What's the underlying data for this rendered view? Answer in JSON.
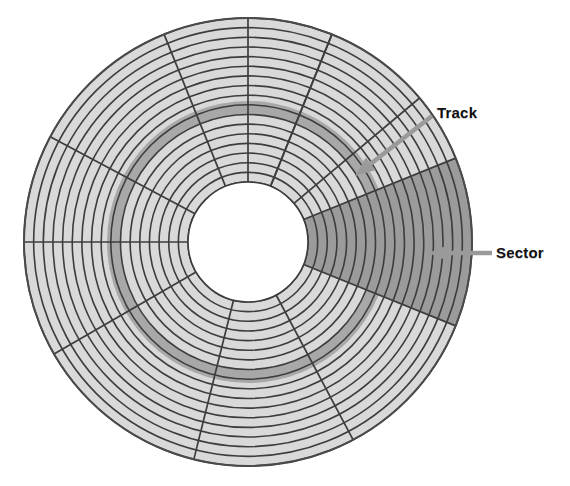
{
  "diagram": {
    "type": "disk-platter-schematic",
    "background_color": "#ffffff",
    "geometry": {
      "center_x": 248,
      "center_y": 242,
      "outer_radius": 224,
      "hub_radius": 60,
      "track_count": 17,
      "spoke_count": 12,
      "highlighted_track_index": 7,
      "highlighted_track_inner_radius": 128,
      "highlighted_track_outer_radius": 141
    },
    "colors": {
      "platter_fill": "#d9d9d9",
      "track_line": "#3d3d3d",
      "highlight_track_fill": "#a8a8a8",
      "sector_fill": "#9b9b9b",
      "hub_fill": "#ffffff",
      "outline": "#4a4a4a",
      "arrow_fill": "#9a9a9a",
      "label_text": "#111111"
    },
    "sector": {
      "start_angle_deg": -22,
      "end_angle_deg": 22,
      "description": "Wedge-shaped sector spanning from the hub center to the platter edge on the right side"
    },
    "callouts": [
      {
        "id": "track",
        "label": "Track",
        "label_x": 437,
        "label_y": 104,
        "arrow_from_x": 432,
        "arrow_from_y": 116,
        "arrow_to_x": 355,
        "arrow_to_y": 176,
        "points_at": "highlighted annular track band"
      },
      {
        "id": "sector",
        "label": "Sector",
        "label_x": 496,
        "label_y": 244,
        "arrow_from_x": 492,
        "arrow_from_y": 253,
        "arrow_to_x": 428,
        "arrow_to_y": 253,
        "points_at": "shaded wedge sector"
      }
    ]
  }
}
